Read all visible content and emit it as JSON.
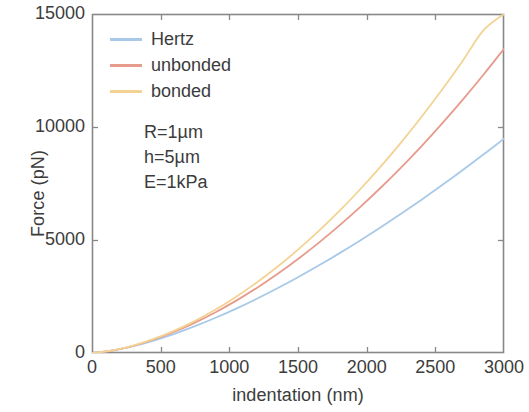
{
  "chart_data": {
    "type": "line",
    "title": "",
    "xlabel": "indentation (nm)",
    "ylabel": "Force (pN)",
    "xlim": [
      0,
      3000
    ],
    "ylim": [
      0,
      15000
    ],
    "xticks": [
      0,
      500,
      1000,
      1500,
      2000,
      2500,
      3000
    ],
    "xtick_labels": [
      "0",
      "500",
      "1000",
      "1500",
      "2000",
      "2500",
      "3000"
    ],
    "yticks": [
      0,
      5000,
      10000,
      15000
    ],
    "ytick_labels": [
      "0",
      "5000",
      "10000",
      "15000"
    ],
    "grid": false,
    "legend_position": "upper left",
    "frame": "box",
    "tick_direction": "in",
    "x": [
      0,
      150,
      300,
      450,
      600,
      750,
      900,
      1050,
      1200,
      1350,
      1500,
      1650,
      1800,
      1950,
      2100,
      2250,
      2400,
      2550,
      2700,
      2850,
      3000
    ],
    "series": [
      {
        "name": "Hertz",
        "color": "#a9c9e8",
        "values": [
          0,
          106,
          300,
          551,
          849,
          1186,
          1559,
          1965,
          2400,
          2864,
          3354,
          3869,
          4408,
          4970,
          5554,
          6159,
          6785,
          7430,
          8095,
          8779,
          9481
        ]
      },
      {
        "name": "unbonded",
        "color": "#e79b8c",
        "values": [
          0,
          110,
          318,
          598,
          942,
          1345,
          1804,
          2317,
          2881,
          3496,
          4160,
          4873,
          5634,
          6443,
          7300,
          8205,
          9158,
          10160,
          11211,
          12311,
          13461
        ]
      },
      {
        "name": "bonded",
        "color": "#f3d393",
        "values": [
          0,
          112,
          327,
          621,
          987,
          1423,
          1925,
          2492,
          3123,
          3817,
          4574,
          5394,
          6277,
          7224,
          8235,
          9311,
          10452,
          11659,
          12933,
          14274,
          15000
        ]
      }
    ],
    "annotations": [
      "R=1µm",
      "h=5µm",
      "E=1kPa"
    ]
  },
  "axis_color": "#888888",
  "text_color": "#3c3c3c"
}
